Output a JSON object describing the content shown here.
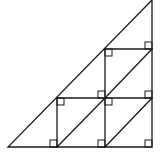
{
  "diagram": {
    "type": "geometry",
    "stroke_color": "#1a1a1a",
    "background": "#ffffff",
    "triangle": {
      "vertices": [
        [
          8,
          147
        ],
        [
          152,
          147
        ],
        [
          152,
          0
        ]
      ]
    },
    "segments": [
      {
        "name": "vertical-left-inner",
        "from": [
          57,
          98
        ],
        "to": [
          57,
          147
        ]
      },
      {
        "name": "vertical-middle",
        "from": [
          105,
          49
        ],
        "to": [
          105,
          147
        ]
      },
      {
        "name": "horizontal-upper",
        "from": [
          105,
          49
        ],
        "to": [
          152,
          49
        ]
      },
      {
        "name": "horizontal-middle",
        "from": [
          57,
          98
        ],
        "to": [
          152,
          98
        ]
      },
      {
        "name": "diagonal-bottom-left-square",
        "from": [
          57,
          147
        ],
        "to": [
          105,
          98
        ]
      },
      {
        "name": "diagonal-bottom-right-square",
        "from": [
          105,
          147
        ],
        "to": [
          152,
          98
        ]
      },
      {
        "name": "diagonal-top-square",
        "from": [
          105,
          98
        ],
        "to": [
          152,
          49
        ]
      }
    ],
    "right_angle_markers": [
      {
        "corner": [
          57,
          147
        ],
        "dir": [
          -1,
          -1
        ]
      },
      {
        "corner": [
          105,
          147
        ],
        "dir": [
          -1,
          -1
        ]
      },
      {
        "corner": [
          152,
          147
        ],
        "dir": [
          -1,
          -1
        ]
      },
      {
        "corner": [
          57,
          98
        ],
        "dir": [
          1,
          1
        ]
      },
      {
        "corner": [
          105,
          98
        ],
        "dir": [
          -1,
          -1
        ]
      },
      {
        "corner": [
          105,
          98
        ],
        "dir": [
          1,
          1
        ]
      },
      {
        "corner": [
          152,
          98
        ],
        "dir": [
          -1,
          -1
        ]
      },
      {
        "corner": [
          105,
          49
        ],
        "dir": [
          1,
          1
        ]
      },
      {
        "corner": [
          152,
          49
        ],
        "dir": [
          -1,
          -1
        ]
      }
    ],
    "marker_size": 7
  }
}
